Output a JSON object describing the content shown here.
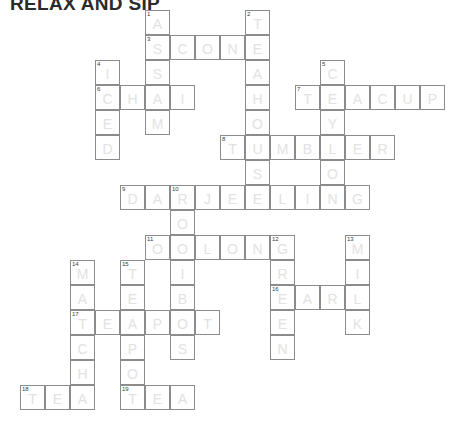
{
  "title": "RELAX AND SIP",
  "grid": {
    "cell_size": 25,
    "origin_x": 20,
    "origin_y": 10,
    "cols": 17,
    "rows": 16,
    "letter_color": "#e2e2e2",
    "border_color": "#8c8c8c",
    "number_color": "#3a3a3a",
    "background": "#ffffff"
  },
  "entries": [
    {
      "number": 1,
      "direction": "down",
      "answer": "ASSAM",
      "col": 5,
      "row": 0
    },
    {
      "number": 2,
      "direction": "down",
      "answer": "TEAHOUSE",
      "col": 9,
      "row": 0
    },
    {
      "number": 3,
      "direction": "across",
      "answer": "SCONE",
      "col": 5,
      "row": 1
    },
    {
      "number": 4,
      "direction": "down",
      "answer": "ICED",
      "col": 3,
      "row": 2
    },
    {
      "number": 5,
      "direction": "down",
      "answer": "CEYLON",
      "col": 12,
      "row": 2
    },
    {
      "number": 6,
      "direction": "across",
      "answer": "CHAI",
      "col": 3,
      "row": 3
    },
    {
      "number": 7,
      "direction": "across",
      "answer": "TEACUP",
      "col": 11,
      "row": 3
    },
    {
      "number": 8,
      "direction": "across",
      "answer": "TUMBLER",
      "col": 8,
      "row": 5
    },
    {
      "number": 9,
      "direction": "across",
      "answer": "DARJEELING",
      "col": 4,
      "row": 7
    },
    {
      "number": 10,
      "direction": "down",
      "answer": "ROOIBOS",
      "col": 6,
      "row": 7
    },
    {
      "number": 11,
      "direction": "across",
      "answer": "OOLONG",
      "col": 5,
      "row": 9
    },
    {
      "number": 12,
      "direction": "down",
      "answer": "GREEN",
      "col": 10,
      "row": 9
    },
    {
      "number": 13,
      "direction": "down",
      "answer": "MILK",
      "col": 13,
      "row": 9
    },
    {
      "number": 14,
      "direction": "down",
      "answer": "MATCHA",
      "col": 2,
      "row": 10
    },
    {
      "number": 15,
      "direction": "down",
      "answer": "TEAPOT",
      "col": 4,
      "row": 10
    },
    {
      "number": 16,
      "direction": "across",
      "answer": "EARL",
      "col": 10,
      "row": 11
    },
    {
      "number": 17,
      "direction": "across",
      "answer": "TEAPOT",
      "col": 2,
      "row": 12
    },
    {
      "number": 18,
      "direction": "across",
      "answer": "TEA",
      "col": 0,
      "row": 15
    },
    {
      "number": 19,
      "direction": "across",
      "answer": "TEA",
      "col": 4,
      "row": 15
    }
  ]
}
